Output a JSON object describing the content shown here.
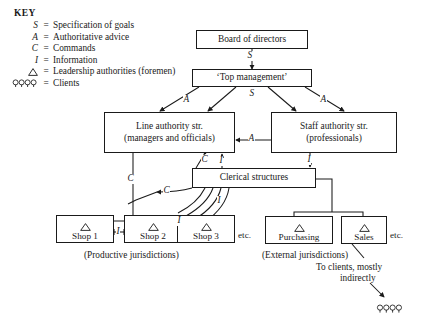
{
  "key": {
    "title": "KEY",
    "entries": [
      {
        "symbol": "S",
        "equals": "=",
        "definition": "Specification of goals",
        "symbol_kind": "letter"
      },
      {
        "symbol": "A",
        "equals": "=",
        "definition": "Authoritative advice",
        "symbol_kind": "letter"
      },
      {
        "symbol": "C",
        "equals": "=",
        "definition": "Commands",
        "symbol_kind": "letter"
      },
      {
        "symbol": "I",
        "equals": "=",
        "definition": "Information",
        "symbol_kind": "letter"
      },
      {
        "symbol": "triangle-icon",
        "equals": "=",
        "definition": "Leadership authorities (foremen)",
        "symbol_kind": "triangle"
      },
      {
        "symbol": "clients-icon",
        "equals": "=",
        "definition": "Clients",
        "symbol_kind": "clients"
      }
    ]
  },
  "nodes": {
    "board": {
      "label": "Board of directors"
    },
    "top_management": {
      "label": "‘Top management’"
    },
    "line_authority": {
      "label": "Line authority str.",
      "sublabel": "(managers and officials)"
    },
    "staff_authority": {
      "label": "Staff authority str.",
      "sublabel": "(professionals)"
    },
    "clerical": {
      "label": "Clerical structures"
    },
    "shop1": {
      "label": "Shop 1"
    },
    "shop2": {
      "label": "Shop 2"
    },
    "shop3": {
      "label": "Shop 3"
    },
    "purchasing": {
      "label": "Purchasing"
    },
    "sales": {
      "label": "Sales"
    }
  },
  "edge_labels": {
    "board_to_top": "S",
    "top_to_line_a": "A",
    "top_to_center_s": "S",
    "top_to_staff_a": "A",
    "staff_to_line_a": "A",
    "line_to_clerical_c": "C",
    "clerical_to_line_i": "I",
    "staff_to_clerical_i": "I",
    "line_to_shops_c": "C",
    "clerical_to_shops_c": "C",
    "shop1_to_shop2_i": "I",
    "shop2_to_shop3_i": "I",
    "shops_to_clerical_i": "I"
  },
  "annotations": {
    "etc_left": "etc.",
    "etc_right": "etc.",
    "productive": "(Productive jurisdictions)",
    "external": "(External jurisdictions)",
    "to_clients_line1": "To clients, mostly",
    "to_clients_line2": "indirectly"
  },
  "colors": {
    "ink": "#1a1a1a",
    "paper": "#ffffff",
    "box_border": "#1a1a1a"
  }
}
